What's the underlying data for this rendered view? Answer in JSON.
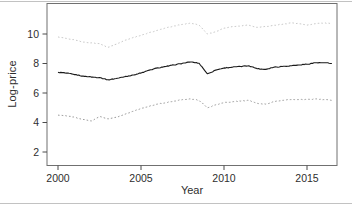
{
  "figure": {
    "xlabel": "Year",
    "ylabel": "Log-price"
  },
  "chart_data": {
    "type": "line",
    "title": "",
    "xlabel": "Year",
    "ylabel": "Log-price",
    "xlim": [
      1999.3,
      2016.8
    ],
    "ylim": [
      1.1,
      12.1
    ],
    "x_ticks": [
      2000,
      2005,
      2010,
      2015
    ],
    "y_ticks": [
      2,
      4,
      6,
      8,
      10
    ],
    "grid": false,
    "legend": null,
    "x": [
      2000,
      2000.5,
      2001,
      2001.5,
      2002,
      2002.5,
      2003,
      2003.5,
      2004,
      2004.5,
      2005,
      2005.5,
      2006,
      2006.5,
      2007,
      2007.5,
      2008,
      2008.5,
      2009,
      2009.5,
      2010,
      2010.5,
      2011,
      2011.5,
      2012,
      2012.5,
      2013,
      2013.5,
      2014,
      2014.5,
      2015,
      2015.5,
      2016,
      2016.5
    ],
    "series": [
      {
        "name": "upper-band",
        "color": "#c9c9c9",
        "style": "dotted",
        "values": [
          9.8,
          9.7,
          9.6,
          9.45,
          9.4,
          9.35,
          9.1,
          9.3,
          9.55,
          9.75,
          9.9,
          10.1,
          10.25,
          10.4,
          10.55,
          10.65,
          10.75,
          10.6,
          10.0,
          10.15,
          10.4,
          10.5,
          10.55,
          10.6,
          10.45,
          10.5,
          10.6,
          10.65,
          10.75,
          10.7,
          10.6,
          10.7,
          10.75,
          10.7
        ]
      },
      {
        "name": "log-price",
        "color": "#1a1a1a",
        "style": "solid",
        "values": [
          7.4,
          7.35,
          7.25,
          7.15,
          7.08,
          7.05,
          6.9,
          6.98,
          7.1,
          7.22,
          7.35,
          7.55,
          7.7,
          7.8,
          7.9,
          8.02,
          8.1,
          8.02,
          7.3,
          7.55,
          7.7,
          7.75,
          7.8,
          7.85,
          7.65,
          7.6,
          7.75,
          7.8,
          7.85,
          7.9,
          7.95,
          8.05,
          8.05,
          8.0
        ]
      },
      {
        "name": "lower-band",
        "color": "#9a9a9a",
        "style": "dotted",
        "values": [
          4.5,
          4.45,
          4.35,
          4.2,
          4.1,
          4.4,
          4.25,
          4.35,
          4.55,
          4.75,
          4.95,
          5.1,
          5.25,
          5.35,
          5.45,
          5.55,
          5.6,
          5.5,
          5.0,
          5.2,
          5.35,
          5.4,
          5.45,
          5.5,
          5.3,
          5.25,
          5.4,
          5.5,
          5.55,
          5.55,
          5.55,
          5.6,
          5.55,
          5.5
        ]
      }
    ]
  },
  "colors": {
    "axis_text": "#2e2e2e",
    "box": "#707070",
    "tick": "#4a4a4a",
    "frame_line": "#c2c2c2",
    "background": "#ffffff"
  }
}
